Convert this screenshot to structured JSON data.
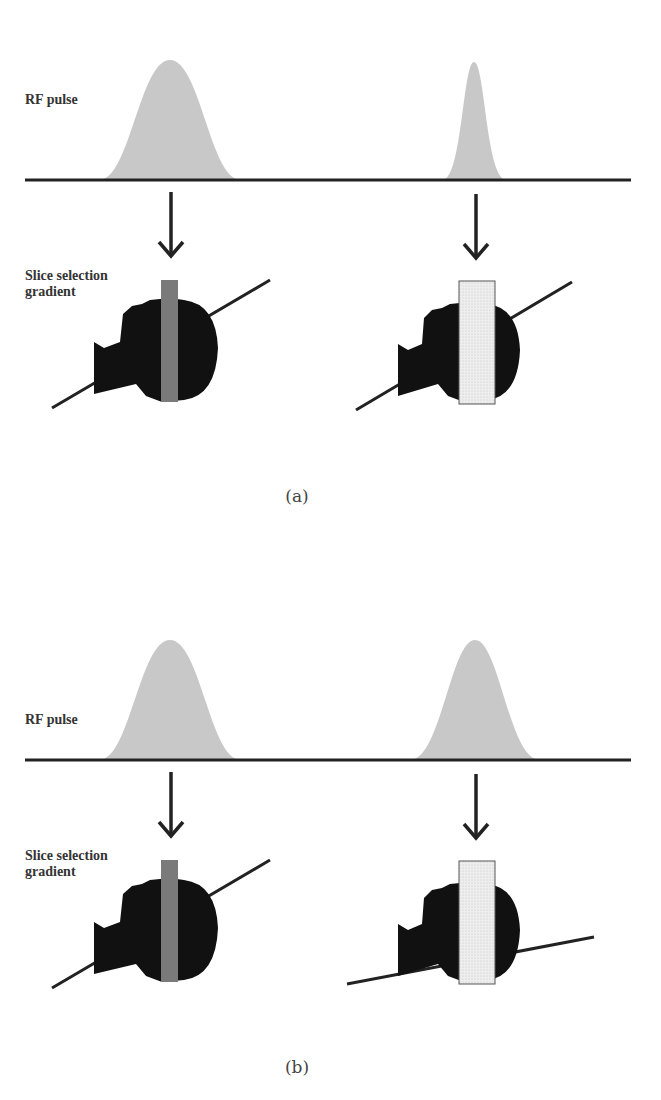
{
  "figure": {
    "panels": [
      {
        "id": "a",
        "caption": "(a)",
        "rf_label": "RF pulse",
        "gradient_label_line1": "Slice selection",
        "gradient_label_line2": "gradient",
        "left": {
          "pulse": "wide",
          "slice": "thin",
          "gradient_slope": "steep"
        },
        "right": {
          "pulse": "narrow",
          "slice": "thick",
          "gradient_slope": "steep"
        }
      },
      {
        "id": "b",
        "caption": "(b)",
        "rf_label": "RF pulse",
        "gradient_label_line1": "Slice selection",
        "gradient_label_line2": "gradient",
        "left": {
          "pulse": "wide",
          "slice": "thin",
          "gradient_slope": "steep"
        },
        "right": {
          "pulse": "wide",
          "slice": "thick",
          "gradient_slope": "shallow"
        }
      }
    ],
    "colors": {
      "pulse_fill": "#c8c8c8",
      "baseline": "#222222",
      "head": "#111111",
      "thin_slice": "#7a7a7a",
      "thick_slice": "#ededed",
      "thick_slice_border": "#555555"
    }
  }
}
